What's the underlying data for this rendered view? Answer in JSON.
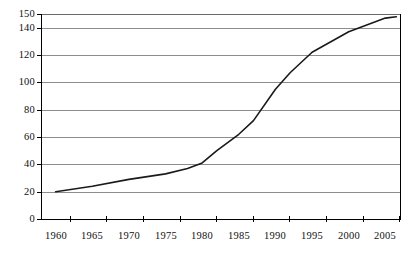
{
  "chart_data": {
    "type": "line",
    "title": "",
    "subtitle": "",
    "xlabel": "",
    "ylabel": "",
    "xlim": [
      1958,
      2007
    ],
    "ylim": [
      0,
      150
    ],
    "grid": true,
    "legend": null,
    "x_ticks": [
      1960,
      1965,
      1970,
      1975,
      1980,
      1985,
      1990,
      1995,
      2000,
      2005
    ],
    "x_tick_labels": [
      "1960",
      "1965",
      "1970",
      "1975",
      "1980",
      "1985",
      "1990",
      "1995",
      "2000",
      "2005"
    ],
    "y_ticks": [
      0,
      20,
      40,
      60,
      80,
      100,
      120,
      140,
      150
    ],
    "y_tick_labels": [
      "0",
      "20",
      "40",
      "60",
      "80",
      "100",
      "120",
      "140",
      "150"
    ],
    "series": [
      {
        "name": "series-1",
        "color": "#1a1a1a",
        "x": [
          1960,
          1965,
          1970,
          1975,
          1978,
          1980,
          1982,
          1985,
          1987,
          1990,
          1992,
          1995,
          2000,
          2005,
          2006.5
        ],
        "values": [
          20,
          24,
          29,
          33,
          37,
          41,
          50,
          62,
          72,
          95,
          107,
          122,
          137,
          147,
          148
        ]
      }
    ]
  },
  "axes": {
    "y_labels": [
      "150",
      "140",
      "120",
      "100",
      "80",
      "60",
      "40",
      "20",
      "0"
    ],
    "x_labels": [
      "1960",
      "1965",
      "1970",
      "1975",
      "1980",
      "1985",
      "1990",
      "1995",
      "2000",
      "2005"
    ]
  },
  "colors": {
    "line": "#1a1a1a",
    "grid": "#8d8d8d",
    "axis": "#000000",
    "background": "#ffffff"
  }
}
